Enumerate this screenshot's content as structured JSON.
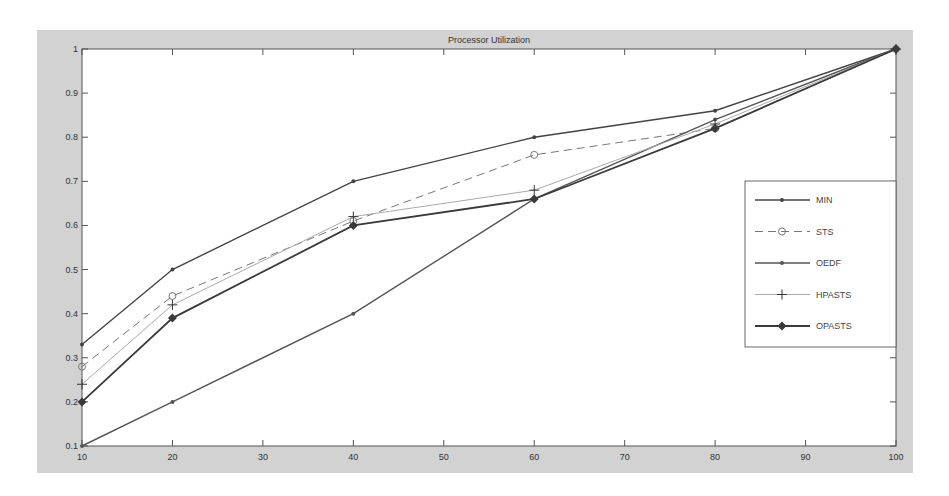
{
  "chart_data": {
    "type": "line",
    "title": "Processor Utilization",
    "xlabel": "",
    "ylabel": "",
    "x": [
      10,
      20,
      40,
      60,
      80,
      100
    ],
    "xlim": [
      10,
      100
    ],
    "ylim": [
      0.1,
      1
    ],
    "xticks": [
      10,
      20,
      30,
      40,
      50,
      60,
      70,
      80,
      90,
      100
    ],
    "yticks": [
      0.1,
      0.2,
      0.3,
      0.4,
      0.5,
      0.6,
      0.7,
      0.8,
      0.9,
      1
    ],
    "ytick_labels": [
      "0.1",
      "0.2",
      "0.3",
      "0.4",
      "0.5",
      "0.6",
      "0.7",
      "0.8",
      "0.9",
      "1"
    ],
    "grid": false,
    "legend_position": "right-center inside",
    "series": [
      {
        "name": "MIN",
        "values": [
          0.33,
          0.5,
          0.7,
          0.8,
          0.86,
          1.0
        ],
        "color": "#444444",
        "dash": "solid",
        "marker": "dot",
        "width": 1.4
      },
      {
        "name": "STS",
        "values": [
          0.28,
          0.44,
          0.61,
          0.76,
          0.82,
          1.0
        ],
        "color": "#777777",
        "dash": "dashed",
        "marker": "circle",
        "width": 1
      },
      {
        "name": "OEDF",
        "values": [
          0.1,
          0.2,
          0.4,
          0.66,
          0.84,
          1.0
        ],
        "color": "#555555",
        "dash": "solid",
        "marker": "dot",
        "width": 1.4
      },
      {
        "name": "HPASTS",
        "values": [
          0.24,
          0.42,
          0.62,
          0.68,
          0.83,
          1.0
        ],
        "color": "#aaaaaa",
        "dash": "solid",
        "marker": "plus",
        "width": 1
      },
      {
        "name": "OPASTS",
        "values": [
          0.2,
          0.39,
          0.6,
          0.66,
          0.82,
          1.0
        ],
        "color": "#3a3a3a",
        "dash": "solid",
        "marker": "diamond",
        "width": 1.8
      }
    ]
  },
  "colors": {
    "figure_background": "#d2d2d2",
    "axes_background": "#ffffff",
    "axis_color": "#555555"
  }
}
